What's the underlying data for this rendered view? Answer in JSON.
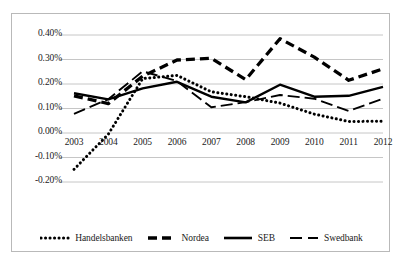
{
  "chart_data": {
    "type": "line",
    "title": "",
    "xlabel": "",
    "ylabel": "",
    "x": [
      2003,
      2004,
      2005,
      2006,
      2007,
      2008,
      2009,
      2010,
      2011,
      2012
    ],
    "categories": [
      "2003",
      "2004",
      "2005",
      "2006",
      "2007",
      "2008",
      "2009",
      "2010",
      "2011",
      "2012"
    ],
    "ylim": [
      -0.2,
      0.4
    ],
    "yticks": [
      -0.2,
      -0.1,
      0.0,
      0.1,
      0.2,
      0.3,
      0.4
    ],
    "ytick_labels": [
      "-0.20%",
      "-0.10%",
      "0.00%",
      "0.10%",
      "0.20%",
      "0.30%",
      "0.40%"
    ],
    "y_unit": "%",
    "grid": true,
    "grid_axis": "y",
    "legend_position": "bottom",
    "series": [
      {
        "name": "Handelsbanken",
        "style": "dotted",
        "color": "#000000",
        "values": [
          -0.148,
          -0.005,
          0.222,
          0.235,
          0.168,
          0.148,
          0.122,
          0.077,
          0.047,
          0.048
        ]
      },
      {
        "name": "Nordea",
        "style": "dashed-thick",
        "color": "#000000",
        "values": [
          0.152,
          0.12,
          0.232,
          0.298,
          0.305,
          0.218,
          0.385,
          0.31,
          0.215,
          0.262
        ]
      },
      {
        "name": "SEB",
        "style": "solid",
        "color": "#000000",
        "values": [
          0.162,
          0.137,
          0.182,
          0.209,
          0.148,
          0.125,
          0.197,
          0.148,
          0.152,
          0.188
        ]
      },
      {
        "name": "Swedbank",
        "style": "long-dash",
        "color": "#000000",
        "values": [
          0.078,
          0.138,
          0.252,
          0.212,
          0.105,
          0.126,
          0.155,
          0.14,
          0.09,
          0.14
        ]
      }
    ]
  },
  "legend": {
    "items": [
      {
        "label": "Handelsbanken",
        "marker": "dotted-line-marker"
      },
      {
        "label": "Nordea",
        "marker": "dashed-thick-line-marker"
      },
      {
        "label": "SEB",
        "marker": "solid-line-marker"
      },
      {
        "label": "Swedbank",
        "marker": "long-dash-line-marker"
      }
    ]
  }
}
